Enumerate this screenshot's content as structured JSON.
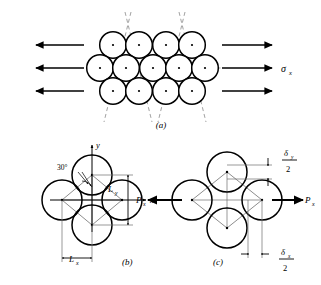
{
  "figure": {
    "title_present": false,
    "panels": [
      {
        "id": "a",
        "caption": "(a)",
        "description": "hexagonal close-packed atom array under uniaxial tension",
        "stress_label": "σ",
        "stress_sub": "x",
        "rows": [
          {
            "count": 4,
            "offset": "staggered-top"
          },
          {
            "count": 5,
            "offset": "aligned-middle"
          },
          {
            "count": 4,
            "offset": "staggered-bottom"
          }
        ],
        "arrow_count_left": 3,
        "arrow_count_right": 3,
        "slip_lines": 4
      },
      {
        "id": "b",
        "caption": "(b)",
        "description": "undeformed rhombic unit cell",
        "axis_x_label": "x",
        "axis_y_label": "y",
        "angle_label": "30°",
        "dim_y_label": "L",
        "dim_y_sub": "y",
        "dim_x_label": "L",
        "dim_x_sub": "x",
        "circle_count": 4
      },
      {
        "id": "c",
        "caption": "(c)",
        "description": "deformed unit cell under load P sub x",
        "load_label_left": "P",
        "load_sub_left": "x",
        "load_label_right": "P",
        "load_sub_right": "x",
        "delta_y_num": "δ",
        "delta_y_sub": "y",
        "delta_y_den": "2",
        "delta_x_num": "δ",
        "delta_x_sub": "x",
        "delta_x_den": "2",
        "circle_count": 4
      }
    ]
  },
  "colors": {
    "ink": "#000000",
    "background": "#ffffff",
    "thin_line": "#555555",
    "dash_line": "#888888"
  }
}
